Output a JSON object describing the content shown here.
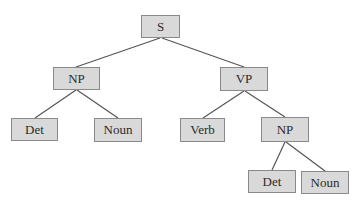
{
  "diagram": {
    "type": "parse-tree",
    "colors": {
      "node_fill": "#d9d9d9",
      "node_border": "#8a8a8a",
      "edge": "#555555",
      "text": "#2b2b2b"
    },
    "nodes": [
      {
        "id": "s",
        "label": "S",
        "x": 141,
        "y": 15,
        "w": 39,
        "h": 23
      },
      {
        "id": "np1",
        "label": "NP",
        "x": 53,
        "y": 67,
        "w": 47,
        "h": 23
      },
      {
        "id": "vp",
        "label": "VP",
        "x": 220,
        "y": 67,
        "w": 48,
        "h": 24
      },
      {
        "id": "det1",
        "label": "Det",
        "x": 11,
        "y": 118,
        "w": 47,
        "h": 23
      },
      {
        "id": "noun1",
        "label": "Noun",
        "x": 94,
        "y": 118,
        "w": 48,
        "h": 24
      },
      {
        "id": "verb",
        "label": "Verb",
        "x": 180,
        "y": 118,
        "w": 45,
        "h": 24
      },
      {
        "id": "np2",
        "label": "NP",
        "x": 261,
        "y": 117,
        "w": 48,
        "h": 25
      },
      {
        "id": "det2",
        "label": "Det",
        "x": 248,
        "y": 170,
        "w": 48,
        "h": 23
      },
      {
        "id": "noun2",
        "label": "Noun",
        "x": 301,
        "y": 171,
        "w": 48,
        "h": 23
      }
    ],
    "edges": [
      [
        "s",
        "np1"
      ],
      [
        "s",
        "vp"
      ],
      [
        "np1",
        "det1"
      ],
      [
        "np1",
        "noun1"
      ],
      [
        "vp",
        "verb"
      ],
      [
        "vp",
        "np2"
      ],
      [
        "np2",
        "det2"
      ],
      [
        "np2",
        "noun2"
      ]
    ]
  }
}
